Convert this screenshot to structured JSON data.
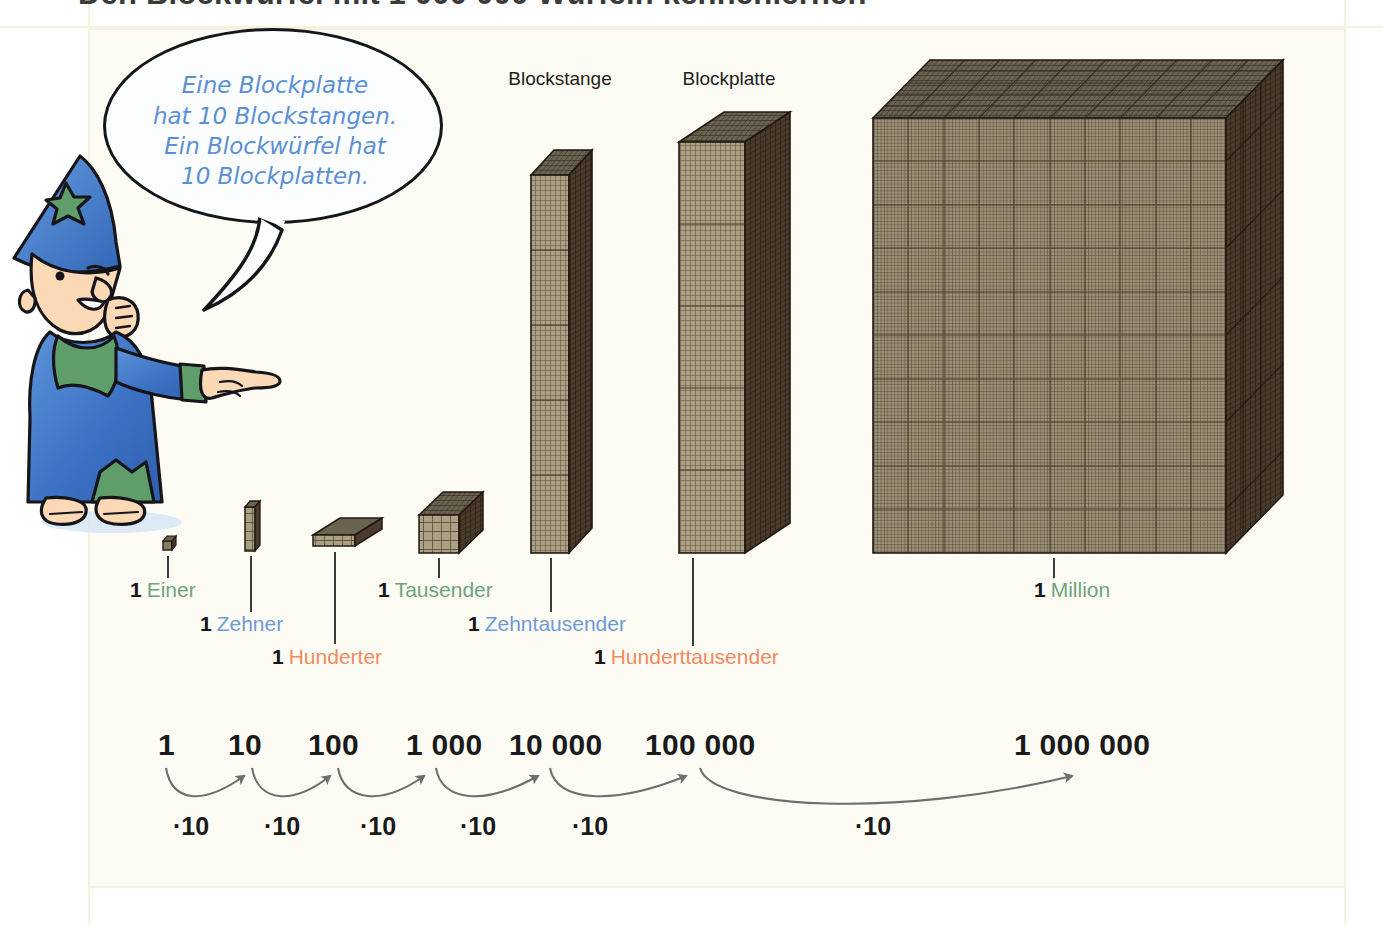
{
  "title": "Den Blockwürfel mit 1 000 000 Würfeln kennenlernen",
  "speech_bubble": {
    "lines": [
      "Eine Blockplatte",
      "hat 10 Blockstangen.",
      "Ein Blockwürfel hat",
      "10 Blockplatten."
    ]
  },
  "block_captions": [
    {
      "label": "Blockstange",
      "x": 560
    },
    {
      "label": "Blockplatte",
      "x": 729
    },
    {
      "label": "Blockwürfel",
      "x": 1083
    }
  ],
  "place_values": [
    {
      "count": "1",
      "name": "Einer",
      "color": "green",
      "x": 130,
      "y": 578
    },
    {
      "count": "1",
      "name": "Zehner",
      "color": "blue",
      "x": 200,
      "y": 612
    },
    {
      "count": "1",
      "name": "Hunderter",
      "color": "orange",
      "x": 272,
      "y": 645
    },
    {
      "count": "1",
      "name": "Tausender",
      "color": "green",
      "x": 378,
      "y": 578
    },
    {
      "count": "1",
      "name": "Zehntausender",
      "color": "blue",
      "x": 468,
      "y": 612
    },
    {
      "count": "1",
      "name": "Hunderttausender",
      "color": "orange",
      "x": 594,
      "y": 645
    },
    {
      "count": "1",
      "name": "Million",
      "color": "green",
      "x": 1034,
      "y": 578
    }
  ],
  "numbers": [
    {
      "text": "1",
      "x": 158
    },
    {
      "text": "10",
      "x": 228
    },
    {
      "text": "100",
      "x": 308
    },
    {
      "text": "1 000",
      "x": 406
    },
    {
      "text": "10 000",
      "x": 509
    },
    {
      "text": "100 000",
      "x": 645
    },
    {
      "text": "1 000 000",
      "x": 1014
    }
  ],
  "multipliers": [
    {
      "text": "·10",
      "x": 173
    },
    {
      "text": "·10",
      "x": 264
    },
    {
      "text": "·10",
      "x": 360
    },
    {
      "text": "·10",
      "x": 460
    },
    {
      "text": "·10",
      "x": 572
    },
    {
      "text": "·10",
      "x": 855
    }
  ],
  "colors": {
    "green": "#6ea37e",
    "blue": "#6f9ad6",
    "orange": "#ef8a61",
    "bubble_text": "#5b8fd4",
    "block_front": "#8a7d66",
    "block_side": "#4a3b2c",
    "block_top": "#6d6croots"
  }
}
